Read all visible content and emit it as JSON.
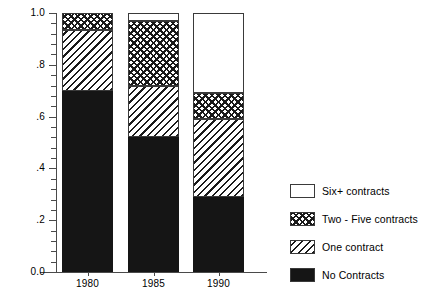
{
  "chart_data": {
    "type": "bar",
    "subtype": "stacked-vertical",
    "title": "",
    "xlabel": "",
    "ylabel": "",
    "categories": [
      "1980",
      "1985",
      "1990"
    ],
    "ylim": [
      0.0,
      1.0
    ],
    "ytick_values": [
      0.0,
      0.2,
      0.4,
      0.6,
      0.8,
      1.0
    ],
    "ytick_labels": [
      "0.0",
      ".2",
      ".4",
      ".6",
      ".8",
      "1.0"
    ],
    "yminor_step": 0.04,
    "grid": false,
    "legend_position": "right",
    "stack_order_bottom_to_top": [
      "No Contracts",
      "One contract",
      "Two - Five contracts",
      "Six+ contracts"
    ],
    "series": [
      {
        "name": "No Contracts",
        "pattern": "solid-black",
        "values": [
          0.7,
          0.52,
          0.29
        ]
      },
      {
        "name": "One contract",
        "pattern": "diagonal-hatch",
        "values": [
          0.235,
          0.2,
          0.3
        ]
      },
      {
        "name": "Two - Five contracts",
        "pattern": "checkerboard",
        "values": [
          0.065,
          0.25,
          0.1
        ]
      },
      {
        "name": "Six+ contracts",
        "pattern": "empty-white",
        "values": [
          0.0,
          0.03,
          0.31
        ]
      }
    ],
    "cumulative_tops": {
      "1980": [
        0.7,
        0.935,
        1.0,
        1.0
      ],
      "1985": [
        0.52,
        0.72,
        0.97,
        1.0
      ],
      "1990": [
        0.29,
        0.59,
        0.69,
        1.0
      ]
    }
  },
  "axes": {
    "y_labels": [
      {
        "text": "1.0",
        "value": 1.0
      },
      {
        "text": ".8",
        "value": 0.8
      },
      {
        "text": ".6",
        "value": 0.6
      },
      {
        "text": ".4",
        "value": 0.4
      },
      {
        "text": ".2",
        "value": 0.2
      },
      {
        "text": "0.0",
        "value": 0.0
      }
    ],
    "x_labels": [
      "1980",
      "1985",
      "1990"
    ]
  },
  "legend": {
    "items": [
      {
        "label": "Six+ contracts",
        "pattern": "empty-white"
      },
      {
        "label": "Two - Five contracts",
        "pattern": "checkerboard"
      },
      {
        "label": "One contract",
        "pattern": "diagonal-hatch"
      },
      {
        "label": "No Contracts",
        "pattern": "solid-black"
      }
    ]
  },
  "colors": {
    "ink": "#151515",
    "axis": "#4a4a4a",
    "background": "#ffffff"
  }
}
